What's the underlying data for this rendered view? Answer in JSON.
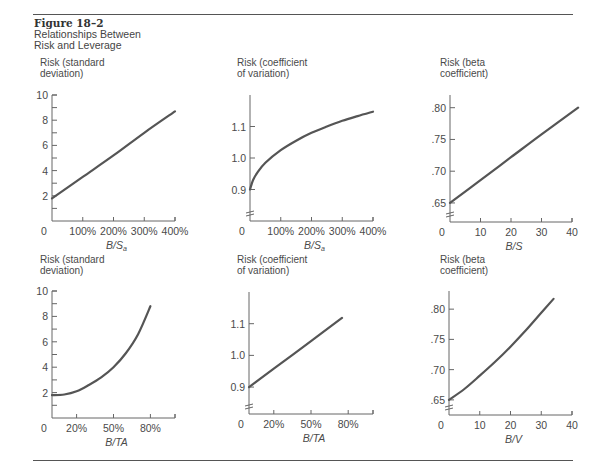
{
  "figure": {
    "number": "Figure 18–2",
    "title_line1": "Relationships Between",
    "title_line2": "Risk and Leverage"
  },
  "colors": {
    "line": "#555555",
    "axis": "#666666",
    "text": "#4a4a4a",
    "rule": "#555555"
  },
  "chart_data": [
    {
      "type": "line",
      "position": "top-left",
      "ylabel": [
        "Risk (standard",
        "deviation)"
      ],
      "xlabel": "B/S",
      "xlabel_sub": "a",
      "x_ticks": [
        0,
        100,
        200,
        300,
        400
      ],
      "x_tick_labels": [
        "0",
        "100%",
        "200%",
        "300%",
        "400%"
      ],
      "y_ticks": [
        2,
        4,
        6,
        8,
        10
      ],
      "y_tick_labels": [
        "2",
        "4",
        "6",
        "8",
        "10"
      ],
      "y_minor": true,
      "xlim": [
        0,
        400
      ],
      "ylim": [
        0,
        10
      ],
      "axis_break": false,
      "x": [
        0,
        100,
        200,
        300,
        400
      ],
      "y": [
        1.8,
        3.5,
        5.2,
        7.0,
        8.7
      ]
    },
    {
      "type": "line",
      "position": "top-center",
      "ylabel": [
        "Risk (coefficient",
        "of variation)"
      ],
      "xlabel": "B/S",
      "xlabel_sub": "a",
      "x_ticks": [
        0,
        100,
        200,
        300,
        400
      ],
      "x_tick_labels": [
        "0",
        "100%",
        "200%",
        "300%",
        "400%"
      ],
      "y_ticks": [
        0.9,
        1.0,
        1.1
      ],
      "y_tick_labels": [
        "0.9",
        "1.0",
        "1.1"
      ],
      "y_minor": false,
      "xlim": [
        0,
        400
      ],
      "ylim": [
        0.8,
        1.2
      ],
      "axis_break": true,
      "x": [
        0,
        10,
        25,
        50,
        100,
        150,
        200,
        250,
        300,
        350,
        400
      ],
      "y": [
        0.9,
        0.93,
        0.955,
        0.985,
        1.025,
        1.055,
        1.08,
        1.1,
        1.118,
        1.133,
        1.147
      ]
    },
    {
      "type": "line",
      "position": "top-right",
      "ylabel": [
        "Risk (beta",
        "coefficient)"
      ],
      "xlabel": "B/S",
      "xlabel_sub": "",
      "x_ticks": [
        0,
        10,
        20,
        30,
        40
      ],
      "x_tick_labels": [
        "0",
        "10",
        "20",
        "30",
        "40"
      ],
      "y_ticks": [
        0.65,
        0.7,
        0.75,
        0.8
      ],
      "y_tick_labels": [
        ".65",
        ".70",
        ".75",
        ".80"
      ],
      "y_minor": false,
      "xlim": [
        0,
        40
      ],
      "ylim": [
        0.62,
        0.82
      ],
      "axis_break": true,
      "x": [
        0,
        10,
        20,
        30,
        42
      ],
      "y": [
        0.65,
        0.686,
        0.722,
        0.758,
        0.8
      ]
    },
    {
      "type": "line",
      "position": "bottom-left",
      "ylabel": [
        "Risk (standard",
        "deviation)"
      ],
      "xlabel": "B/TA",
      "xlabel_sub": "",
      "x_ticks": [
        0,
        20,
        50,
        80,
        100
      ],
      "x_tick_labels": [
        "0",
        "20%",
        "50%",
        "80%",
        ""
      ],
      "y_ticks": [
        2,
        4,
        6,
        8,
        10
      ],
      "y_tick_labels": [
        "2",
        "4",
        "6",
        "8",
        "10"
      ],
      "y_minor": true,
      "xlim": [
        0,
        100
      ],
      "ylim": [
        0,
        10
      ],
      "axis_break": false,
      "x": [
        0,
        10,
        20,
        30,
        40,
        50,
        60,
        70,
        80
      ],
      "y": [
        1.8,
        1.85,
        2.1,
        2.6,
        3.2,
        4.0,
        5.1,
        6.6,
        8.8
      ]
    },
    {
      "type": "line",
      "position": "bottom-center",
      "ylabel": [
        "Risk (coefficient",
        "of variation)"
      ],
      "xlabel": "B/TA",
      "xlabel_sub": "",
      "x_ticks": [
        0,
        20,
        50,
        80,
        100
      ],
      "x_tick_labels": [
        "0",
        "20%",
        "50%",
        "80%",
        ""
      ],
      "y_ticks": [
        0.9,
        1.0,
        1.1
      ],
      "y_tick_labels": [
        "0.9",
        "1.0",
        "1.1"
      ],
      "y_minor": false,
      "xlim": [
        0,
        100
      ],
      "ylim": [
        0.815,
        1.2
      ],
      "axis_break": true,
      "x": [
        0,
        20,
        50,
        75
      ],
      "y": [
        0.9,
        0.958,
        1.045,
        1.118
      ]
    },
    {
      "type": "line",
      "position": "bottom-right",
      "ylabel": [
        "Risk (beta",
        "coefficient)"
      ],
      "xlabel": "B/V",
      "xlabel_sub": "",
      "x_ticks": [
        0,
        10,
        20,
        30,
        40
      ],
      "x_tick_labels": [
        "0",
        "10",
        "20",
        "30",
        "40"
      ],
      "y_ticks": [
        0.65,
        0.7,
        0.75,
        0.8
      ],
      "y_tick_labels": [
        ".65",
        ".70",
        ".75",
        ".80"
      ],
      "y_minor": false,
      "xlim": [
        0,
        40
      ],
      "ylim": [
        0.625,
        0.83
      ],
      "axis_break": true,
      "x": [
        0,
        5,
        10,
        15,
        20,
        25,
        30,
        34
      ],
      "y": [
        0.65,
        0.668,
        0.69,
        0.713,
        0.738,
        0.765,
        0.794,
        0.817
      ]
    }
  ]
}
